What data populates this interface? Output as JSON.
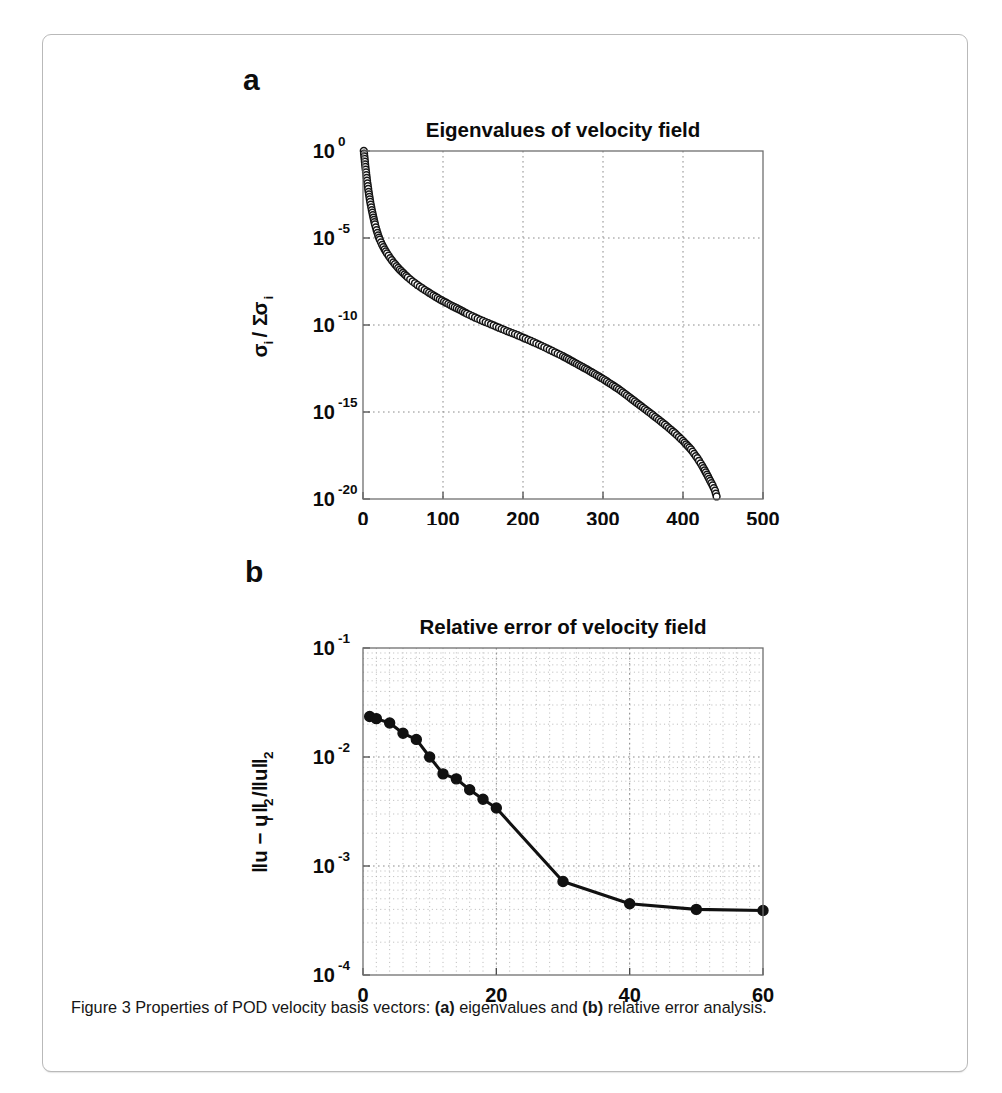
{
  "figure": {
    "caption_prefix": "Figure 3 Properties of POD velocity basis vectors: ",
    "caption_a_tag": "(a)",
    "caption_mid": " eigenvalues and ",
    "caption_b_tag": "(b)",
    "caption_suffix": " relative error analysis.",
    "panel_a_letter": "a",
    "panel_b_letter": "b",
    "border_color": "#b9b9b9",
    "series_color": "#111111"
  },
  "chart_data": [
    {
      "id": "panel-a",
      "type": "scatter",
      "title": "Eigenvalues of velocity field",
      "xlabel": "i",
      "ylabel_parts": [
        "σ",
        "i",
        " / Σ ",
        "σ",
        "i"
      ],
      "ylabel": "σi / Σ σi",
      "xscale": "linear",
      "yscale": "log",
      "xlim": [
        0,
        500
      ],
      "ylim": [
        1e-20,
        1
      ],
      "xticks": [
        0,
        100,
        200,
        300,
        400,
        500
      ],
      "xticklabels": [
        "0",
        "100",
        "200",
        "300",
        "400",
        "500"
      ],
      "yticks": [
        1,
        1e-05,
        1e-10,
        1e-15,
        1e-20
      ],
      "yticklabels": [
        {
          "mantissa": "10",
          "exponent": "0"
        },
        {
          "mantissa": "10",
          "exponent": "-5"
        },
        {
          "mantissa": "10",
          "exponent": "-10"
        },
        {
          "mantissa": "10",
          "exponent": "-15"
        },
        {
          "mantissa": "10",
          "exponent": "-20"
        }
      ],
      "grid": true,
      "grid_minor": false,
      "marker": "open-circle",
      "legend": null,
      "x": [
        1,
        3,
        5,
        7,
        9,
        11,
        13,
        15,
        17,
        19,
        21,
        24,
        27,
        30,
        34,
        38,
        42,
        46,
        50,
        56,
        62,
        68,
        74,
        80,
        88,
        96,
        104,
        112,
        120,
        130,
        140,
        150,
        160,
        170,
        180,
        190,
        200,
        210,
        220,
        230,
        240,
        250,
        260,
        270,
        280,
        290,
        300,
        310,
        320,
        330,
        340,
        350,
        360,
        370,
        380,
        390,
        400,
        410,
        418,
        424,
        430,
        434,
        437,
        440,
        442
      ],
      "y": [
        1.0,
        0.12,
        0.02,
        0.0045,
        0.0012,
        0.0004,
        0.00015,
        6e-05,
        2.8e-05,
        1.4e-05,
        8e-06,
        4e-06,
        2.2e-06,
        1.3e-06,
        7e-07,
        4e-07,
        2.4e-07,
        1.5e-07,
        1e-07,
        5.5e-08,
        3.2e-08,
        2e-08,
        1.3e-08,
        8.5e-09,
        5e-09,
        3e-09,
        1.9e-09,
        1.2e-09,
        8e-10,
        4.5e-10,
        2.7e-10,
        1.7e-10,
        1.1e-10,
        7e-11,
        4.5e-11,
        3e-11,
        1.9e-11,
        1.2e-11,
        7.5e-12,
        4.5e-12,
        2.7e-12,
        1.6e-12,
        9e-13,
        5e-13,
        2.8e-13,
        1.5e-13,
        8e-14,
        4e-14,
        2e-14,
        9e-15,
        4e-15,
        1.8e-15,
        8e-16,
        3.5e-16,
        1.5e-16,
        6e-17,
        2.2e-17,
        7e-18,
        2.2e-18,
        8e-19,
        2.5e-19,
        1.1e-19,
        6e-20,
        3e-20,
        1.4e-20
      ],
      "n_points": 442,
      "notes": "Dense overlapping open-circle markers forming a thick decaying band from 10^0 at i=1 down to ~10^-20 at i~440."
    },
    {
      "id": "panel-b",
      "type": "line",
      "title": "Relative error of velocity field",
      "xlabel": "Number of POD modes",
      "ylabel": "‖u − u_r‖₂/‖u‖₂",
      "xscale": "linear",
      "yscale": "log",
      "xlim": [
        0,
        60
      ],
      "ylim": [
        0.0001,
        0.1
      ],
      "xticks": [
        0,
        20,
        40,
        60
      ],
      "xticklabels": [
        "0",
        "20",
        "40",
        "60"
      ],
      "yticks": [
        0.1,
        0.01,
        0.001,
        0.0001
      ],
      "yticklabels": [
        {
          "mantissa": "10",
          "exponent": "-1"
        },
        {
          "mantissa": "10",
          "exponent": "-2"
        },
        {
          "mantissa": "10",
          "exponent": "-3"
        },
        {
          "mantissa": "10",
          "exponent": "-4"
        }
      ],
      "grid": true,
      "grid_minor": true,
      "marker": "filled-circle",
      "legend": null,
      "x": [
        1,
        2,
        4,
        6,
        8,
        10,
        12,
        14,
        16,
        18,
        20,
        30,
        40,
        50,
        60
      ],
      "y": [
        0.0235,
        0.0225,
        0.0205,
        0.0165,
        0.0145,
        0.01,
        0.007,
        0.0063,
        0.005,
        0.0041,
        0.0034,
        0.00072,
        0.00045,
        0.0004,
        0.00039
      ],
      "notes": "Monotonically decreasing relative error that plateaus near 4e-4 beyond 40 modes."
    }
  ]
}
